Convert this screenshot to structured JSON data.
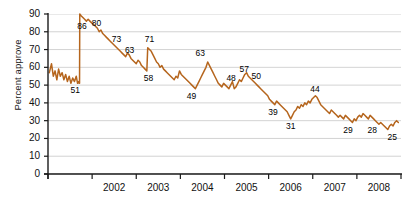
{
  "chart_data": {
    "type": "line",
    "title": "",
    "xlabel": "",
    "ylabel": "Percent approve",
    "ylim": [
      0,
      90
    ],
    "xlim": [
      2001.0,
      2009.0
    ],
    "yticks": [
      0,
      10,
      20,
      30,
      40,
      50,
      60,
      70,
      80,
      90
    ],
    "ytick_labels": [
      "0",
      "10",
      "20",
      "30",
      "40",
      "50",
      "60",
      "70",
      "80",
      "90"
    ],
    "xticks": [
      2002,
      2003,
      2004,
      2005,
      2006,
      2007,
      2008
    ],
    "xtick_labels": [
      "2002",
      "2003",
      "2004",
      "2005",
      "2006",
      "2007",
      "2008"
    ],
    "grid": "horizontal",
    "legend": "none",
    "line_color": "#B5651D",
    "series": [
      {
        "name": "Percent approve",
        "x": [
          2001.03,
          2001.08,
          2001.12,
          2001.16,
          2001.2,
          2001.24,
          2001.28,
          2001.32,
          2001.36,
          2001.4,
          2001.44,
          2001.48,
          2001.52,
          2001.56,
          2001.6,
          2001.64,
          2001.67,
          2001.69,
          2001.705,
          2001.715,
          2001.72,
          2001.75,
          2001.79,
          2001.83,
          2001.87,
          2001.91,
          2001.95,
          2001.99,
          2002.04,
          2002.08,
          2002.12,
          2002.16,
          2002.2,
          2002.24,
          2002.28,
          2002.32,
          2002.36,
          2002.4,
          2002.44,
          2002.48,
          2002.52,
          2002.56,
          2002.6,
          2002.64,
          2002.68,
          2002.72,
          2002.76,
          2002.8,
          2002.84,
          2002.88,
          2002.92,
          2002.96,
          2003.0,
          2003.04,
          2003.08,
          2003.12,
          2003.16,
          2003.2,
          2003.24,
          2003.26,
          2003.3,
          2003.34,
          2003.38,
          2003.42,
          2003.46,
          2003.5,
          2003.54,
          2003.58,
          2003.62,
          2003.66,
          2003.7,
          2003.74,
          2003.78,
          2003.82,
          2003.86,
          2003.9,
          2003.94,
          2003.98,
          2004.02,
          2004.06,
          2004.1,
          2004.14,
          2004.18,
          2004.22,
          2004.26,
          2004.3,
          2004.34,
          2004.38,
          2004.42,
          2004.46,
          2004.5,
          2004.54,
          2004.58,
          2004.62,
          2004.66,
          2004.7,
          2004.74,
          2004.78,
          2004.82,
          2004.86,
          2004.9,
          2004.94,
          2004.98,
          2005.02,
          2005.06,
          2005.1,
          2005.14,
          2005.18,
          2005.22,
          2005.26,
          2005.3,
          2005.34,
          2005.38,
          2005.42,
          2005.46,
          2005.5,
          2005.54,
          2005.58,
          2005.62,
          2005.66,
          2005.7,
          2005.74,
          2005.78,
          2005.82,
          2005.86,
          2005.9,
          2005.94,
          2005.98,
          2006.02,
          2006.06,
          2006.1,
          2006.14,
          2006.18,
          2006.22,
          2006.26,
          2006.3,
          2006.34,
          2006.38,
          2006.42,
          2006.46,
          2006.5,
          2006.54,
          2006.58,
          2006.62,
          2006.66,
          2006.7,
          2006.74,
          2006.78,
          2006.82,
          2006.86,
          2006.9,
          2006.94,
          2006.98,
          2007.02,
          2007.06,
          2007.1,
          2007.14,
          2007.18,
          2007.22,
          2007.26,
          2007.3,
          2007.34,
          2007.38,
          2007.42,
          2007.46,
          2007.5,
          2007.54,
          2007.58,
          2007.62,
          2007.66,
          2007.7,
          2007.74,
          2007.78,
          2007.82,
          2007.86,
          2007.9,
          2007.94,
          2007.98,
          2008.02,
          2008.06,
          2008.1,
          2008.14,
          2008.18,
          2008.22,
          2008.26,
          2008.3,
          2008.34,
          2008.38,
          2008.42,
          2008.46,
          2008.5,
          2008.54,
          2008.58,
          2008.62,
          2008.66,
          2008.7,
          2008.74,
          2008.78,
          2008.82,
          2008.86,
          2008.9,
          2008.94
        ],
        "y": [
          57,
          62,
          55,
          58,
          53,
          59,
          55,
          57,
          53,
          56,
          52,
          55,
          51,
          54,
          52,
          55,
          51,
          52,
          51,
          51,
          90,
          89,
          88,
          87,
          86,
          87,
          86,
          85,
          84,
          83,
          82,
          80,
          81,
          79,
          78,
          77,
          76,
          75,
          74,
          73,
          72,
          71,
          70,
          69,
          68,
          67,
          66,
          68,
          67,
          65,
          64,
          63,
          62,
          64,
          63,
          61,
          60,
          59,
          58,
          71,
          70,
          69,
          67,
          65,
          63,
          62,
          60,
          61,
          59,
          58,
          57,
          56,
          55,
          54,
          53,
          55,
          54,
          58,
          56,
          55,
          54,
          53,
          52,
          51,
          50,
          49,
          48,
          50,
          52,
          54,
          56,
          58,
          60,
          63,
          61,
          59,
          57,
          55,
          53,
          51,
          50,
          49,
          51,
          50,
          49,
          48,
          50,
          52,
          48,
          49,
          51,
          53,
          52,
          54,
          56,
          57,
          55,
          54,
          53,
          52,
          51,
          50,
          49,
          48,
          47,
          46,
          45,
          44,
          42,
          41,
          40,
          39,
          41,
          40,
          39,
          38,
          37,
          36,
          35,
          33,
          31,
          33,
          35,
          36,
          38,
          37,
          39,
          38,
          40,
          39,
          41,
          40,
          42,
          43,
          44,
          43,
          41,
          39,
          38,
          37,
          36,
          35,
          34,
          36,
          35,
          34,
          33,
          32,
          33,
          32,
          31,
          33,
          32,
          31,
          30,
          29,
          31,
          30,
          32,
          33,
          32,
          34,
          33,
          32,
          31,
          33,
          32,
          31,
          30,
          29,
          28,
          29,
          28,
          27,
          26,
          25,
          27,
          28,
          27,
          29,
          30,
          29
        ]
      }
    ],
    "point_labels": [
      {
        "text": "51",
        "x": 2001.62,
        "y": 47,
        "dx": 0,
        "dy": 0
      },
      {
        "text": "86",
        "x": 2001.77,
        "y": 83,
        "dx": 0,
        "dy": 0
      },
      {
        "text": "80",
        "x": 2002.1,
        "y": 85,
        "dx": 0,
        "dy": 0
      },
      {
        "text": "73",
        "x": 2002.55,
        "y": 76,
        "dx": 0,
        "dy": 0
      },
      {
        "text": "63",
        "x": 2002.85,
        "y": 70,
        "dx": 0,
        "dy": 0
      },
      {
        "text": "71",
        "x": 2003.3,
        "y": 76,
        "dx": 0,
        "dy": 0
      },
      {
        "text": "58",
        "x": 2003.28,
        "y": 54,
        "dx": 0,
        "dy": 0
      },
      {
        "text": "63",
        "x": 2004.45,
        "y": 68,
        "dx": 0,
        "dy": 0
      },
      {
        "text": "49",
        "x": 2004.25,
        "y": 44,
        "dx": 0,
        "dy": 0
      },
      {
        "text": "48",
        "x": 2005.15,
        "y": 54,
        "dx": 0,
        "dy": 0
      },
      {
        "text": "57",
        "x": 2005.45,
        "y": 59,
        "dx": 0,
        "dy": 0
      },
      {
        "text": "50",
        "x": 2005.72,
        "y": 55,
        "dx": 0,
        "dy": 0
      },
      {
        "text": "39",
        "x": 2006.1,
        "y": 35,
        "dx": 0,
        "dy": 0
      },
      {
        "text": "31",
        "x": 2006.5,
        "y": 27,
        "dx": 0,
        "dy": 0
      },
      {
        "text": "44",
        "x": 2007.05,
        "y": 48,
        "dx": 0,
        "dy": 0
      },
      {
        "text": "29",
        "x": 2007.8,
        "y": 25,
        "dx": 0,
        "dy": 0
      },
      {
        "text": "28",
        "x": 2008.35,
        "y": 25,
        "dx": 0,
        "dy": 0
      },
      {
        "text": "25",
        "x": 2008.8,
        "y": 21,
        "dx": 0,
        "dy": 0
      }
    ]
  }
}
